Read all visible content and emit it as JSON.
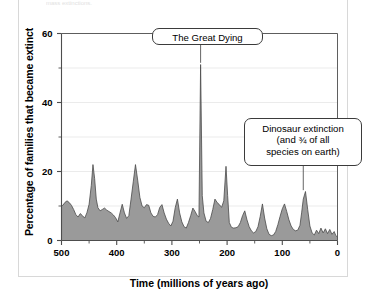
{
  "figure": {
    "clipped_caption": "mass extinctions.",
    "background": "#ffffff",
    "frame_color": "#d8d8d8"
  },
  "chart_data": {
    "type": "area",
    "title": "",
    "xlabel": "Time  (millions of years ago)",
    "ylabel": "Percentage of families that became extinct",
    "xlim": [
      500,
      0
    ],
    "ylim": [
      0,
      60
    ],
    "x_reversed": true,
    "grid": true,
    "grid_axis": "y",
    "legend": "none",
    "fill_color": "#9a9a9a",
    "line_color": "#4a4a4a",
    "axis_color": "#4d4d4d",
    "xticks": [
      500,
      400,
      300,
      200,
      100,
      0
    ],
    "xtick_labels": [
      "500",
      "400",
      "300",
      "200",
      "100",
      "0"
    ],
    "x_minor_ticks": [
      450,
      350,
      250,
      150,
      50
    ],
    "yticks": [
      0,
      20,
      40,
      60
    ],
    "ytick_labels": [
      "0",
      "20",
      "40",
      "60"
    ],
    "y_minor_ticks": [
      10,
      30,
      50
    ],
    "series_name": "Family-level extinction rate",
    "x": [
      500,
      497,
      494,
      490,
      486,
      482,
      478,
      474,
      470,
      466,
      462,
      458,
      454,
      450,
      446,
      443,
      440,
      437,
      434,
      430,
      426,
      422,
      418,
      414,
      410,
      406,
      402,
      398,
      394,
      390,
      386,
      382,
      378,
      374,
      370,
      366,
      362,
      358,
      354,
      350,
      346,
      342,
      338,
      334,
      330,
      326,
      322,
      318,
      314,
      310,
      306,
      302,
      298,
      294,
      290,
      286,
      282,
      278,
      274,
      270,
      266,
      262,
      258,
      254,
      251,
      248,
      245,
      242,
      238,
      234,
      230,
      226,
      222,
      218,
      214,
      210,
      206,
      202,
      199,
      196,
      192,
      188,
      184,
      180,
      176,
      172,
      168,
      164,
      160,
      156,
      152,
      148,
      144,
      140,
      136,
      132,
      128,
      124,
      120,
      116,
      112,
      108,
      104,
      100,
      96,
      92,
      88,
      84,
      80,
      76,
      72,
      68,
      65,
      62,
      58,
      54,
      50,
      46,
      42,
      38,
      34,
      30,
      26,
      22,
      18,
      14,
      10,
      6,
      3,
      0
    ],
    "values": [
      10.0,
      10.3,
      11.0,
      11.5,
      11.0,
      10.2,
      9.0,
      7.5,
      6.8,
      7.8,
      7.2,
      6.5,
      8.0,
      10.5,
      16.0,
      22.0,
      18.0,
      12.0,
      9.5,
      8.6,
      9.0,
      9.4,
      8.8,
      8.4,
      8.0,
      7.4,
      6.6,
      5.4,
      8.0,
      10.5,
      8.0,
      6.4,
      7.2,
      12.0,
      17.0,
      22.0,
      17.5,
      12.5,
      10.0,
      9.5,
      10.4,
      10.2,
      8.0,
      7.0,
      6.8,
      7.5,
      9.6,
      10.4,
      8.0,
      6.2,
      5.0,
      4.2,
      5.6,
      9.5,
      12.0,
      8.0,
      5.4,
      4.0,
      3.6,
      5.2,
      7.2,
      9.4,
      8.4,
      7.2,
      6.8,
      51.0,
      13.0,
      8.0,
      5.6,
      5.2,
      6.4,
      9.0,
      12.0,
      11.0,
      10.4,
      9.6,
      11.5,
      21.5,
      13.0,
      5.2,
      3.8,
      3.6,
      3.7,
      4.0,
      5.2,
      7.2,
      8.6,
      6.0,
      4.0,
      2.8,
      2.2,
      2.6,
      4.0,
      7.0,
      10.6,
      6.5,
      3.4,
      1.8,
      1.4,
      1.6,
      2.6,
      4.6,
      7.0,
      9.2,
      10.6,
      8.4,
      6.0,
      4.2,
      3.2,
      2.8,
      3.0,
      4.4,
      8.0,
      12.0,
      14.2,
      9.0,
      4.2,
      2.2,
      1.6,
      3.0,
      2.0,
      3.6,
      2.2,
      3.4,
      2.0,
      3.2,
      1.8,
      2.6,
      1.4,
      1.0
    ],
    "annotations": [
      {
        "id": "great-dying",
        "label": "The Great Dying",
        "x": 248,
        "y": 51,
        "box_x": 248,
        "box_y": 60
      },
      {
        "id": "dinosaur-extinction",
        "label": "Dinosaur extinction\n(and ¾ of all\nspecies on earth)",
        "line1": "Dinosaur extinction",
        "line2": "(and ¾ of all",
        "line3": "species on earth)",
        "x": 65,
        "y": 14.2,
        "box_x": 62,
        "box_y": 34
      }
    ]
  }
}
